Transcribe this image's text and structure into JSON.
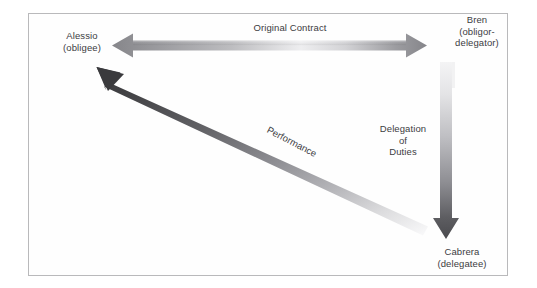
{
  "figure": {
    "type": "diagram",
    "background_color": "#ffffff",
    "frame_color": "#b9b9bb",
    "text_color": "#3c3c3f"
  },
  "nodes": [
    {
      "id": "alessio",
      "name": "Alessio",
      "role": "(obligee)",
      "position": "top-left"
    },
    {
      "id": "bren",
      "name": "Bren",
      "role_line_1": "(obligor-",
      "role_line_2": "delegator)",
      "position": "top-right"
    },
    {
      "id": "cabrera",
      "name": "Cabrera",
      "role": "(delegatee)",
      "position": "bottom-right"
    }
  ],
  "arrows": [
    {
      "id": "original-contract",
      "label": "Original Contract",
      "direction": "bidirectional",
      "orientation": "horizontal",
      "from": "Alessio",
      "to": "Bren",
      "gradient_start": "#8d8d90",
      "gradient_mid": "#f2f2f3",
      "gradient_end": "#8a8a8d"
    },
    {
      "id": "delegation-of-duties",
      "label_line_1": "Delegation",
      "label_line_2": "of",
      "label_line_3": "Duties",
      "direction": "unidirectional",
      "orientation": "vertical",
      "from": "Bren",
      "to": "Cabrera",
      "gradient_start": "#efefef",
      "gradient_end": "#4a4a4d"
    },
    {
      "id": "performance",
      "label": "Performance",
      "direction": "unidirectional",
      "orientation": "diagonal",
      "from": "Cabrera",
      "to": "Alessio",
      "gradient_start": "#3b3b3e",
      "gradient_end": "#fbfbfb"
    }
  ]
}
